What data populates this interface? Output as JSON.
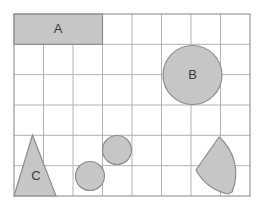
{
  "figure": {
    "background_color": "#ffffff",
    "frame": {
      "name": "grid-frame",
      "x": 14,
      "y": 14,
      "width": 236,
      "height": 182,
      "border_color": "#9a9a9a",
      "border_width": 1.2,
      "fill": "#ffffff"
    },
    "grid": {
      "columns": 8,
      "rows": 6,
      "cell_width": 29.5,
      "cell_height": 30.33,
      "line_color": "#b4b4b4",
      "line_width": 1
    },
    "shape_style": {
      "fill": "#c6c6c6",
      "stroke": "#8d8d8d",
      "stroke_width": 1.2
    },
    "shapes": [
      {
        "id": "shape-a",
        "name": "rectangle-a",
        "type": "rectangle",
        "label": "A",
        "x": 14,
        "y": 14,
        "width": 88.5,
        "height": 30.33,
        "label_x": 58,
        "label_y": 30
      },
      {
        "id": "shape-b",
        "name": "circle-b",
        "type": "circle",
        "label": "B",
        "cx": 192.5,
        "cy": 75,
        "r": 29.5,
        "label_x": 192.5,
        "label_y": 76
      },
      {
        "id": "shape-c",
        "name": "triangle-c",
        "type": "triangle",
        "label": "C",
        "points": "32.5,135 14,196 56,196",
        "label_x": 36,
        "label_y": 177
      },
      {
        "id": "shape-small-circle-upper",
        "name": "circle-small-upper",
        "type": "circle",
        "label": "",
        "cx": 117,
        "cy": 150,
        "r": 14.5,
        "label_x": 117,
        "label_y": 150
      },
      {
        "id": "shape-small-circle-lower",
        "name": "circle-small-lower",
        "type": "circle",
        "label": "",
        "cx": 90,
        "cy": 176,
        "r": 14.5,
        "label_x": 90,
        "label_y": 176
      },
      {
        "id": "shape-sector",
        "name": "pie-sector",
        "type": "sector",
        "label": "",
        "path": "M 219 137 A 48 48 0 0 1 232 192 L 228 194 A 48 48 0 0 1 196 170 Z",
        "label_x": 220,
        "label_y": 170
      }
    ],
    "labels": {
      "a": "A",
      "b": "B",
      "c": "C"
    }
  }
}
